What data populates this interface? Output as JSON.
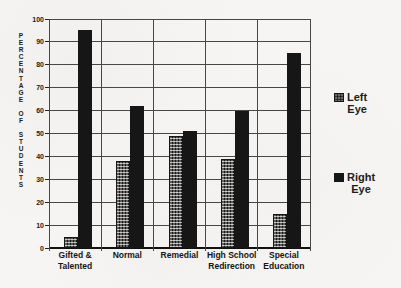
{
  "chart_data": {
    "type": "bar",
    "title": "",
    "categories": [
      "Gifted & Talented",
      "Normal",
      "Remedial",
      "High School Redirection",
      "Special Education"
    ],
    "category_label_lines": [
      [
        "Gifted &",
        "Talented"
      ],
      [
        "Normal"
      ],
      [
        "Remedial"
      ],
      [
        "High School",
        "Redirection"
      ],
      [
        "Special",
        "Education"
      ]
    ],
    "series": [
      {
        "name": "Left Eye",
        "style": "dotted",
        "values": [
          5,
          38,
          49,
          39,
          15
        ]
      },
      {
        "name": "Right Eye",
        "style": "solid",
        "values": [
          95,
          62,
          51,
          60,
          85
        ]
      }
    ],
    "xlabel": "",
    "ylabel": "PERCENTAGE OF STUDENTS",
    "ylim": [
      0,
      100
    ],
    "yticks": [
      0,
      10,
      20,
      30,
      40,
      50,
      60,
      70,
      80,
      90,
      100
    ],
    "grid": true,
    "legend_position": "right"
  },
  "legend": {
    "items": [
      {
        "line1": "Left",
        "line2": "Eye",
        "swatch": "dotted"
      },
      {
        "line1": "Right",
        "line2": "Eye",
        "swatch": "solid"
      }
    ]
  },
  "colors": {
    "bar_fill": "#161616",
    "background": "#f6f5f3",
    "grid_line": "#474747",
    "text": "#161616"
  }
}
